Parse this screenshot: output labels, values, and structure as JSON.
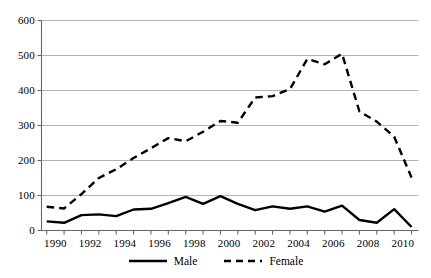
{
  "chart_data": {
    "type": "line",
    "title": "",
    "xlabel": "",
    "ylabel": "",
    "xlim": [
      1989.2,
      1910.8
    ],
    "ylim": [
      0,
      600
    ],
    "grid": true,
    "legend_position": "bottom-center",
    "y_ticks": [
      0,
      100,
      200,
      300,
      400,
      500,
      600
    ],
    "y_tick_labels": [
      "0",
      "100",
      "200",
      "300",
      "400",
      "500",
      "600"
    ],
    "x_tick_labels": [
      "1990",
      "1992",
      "1994",
      "1996",
      "1998",
      "2000",
      "2002",
      "2004",
      "2006",
      "2008",
      "2010"
    ],
    "x_tick_values": [
      1990,
      1992,
      1994,
      1996,
      1998,
      2000,
      2002,
      2004,
      2006,
      2008,
      2010
    ],
    "x_minor_ticks": [
      1989.5,
      1990.5,
      1991.5,
      1992.5,
      1993.5,
      1994.5,
      1995.5,
      1996.5,
      1997.5,
      1998.5,
      1999.5,
      2000.5,
      2001.5,
      2002.5,
      2003.5,
      2004.5,
      2005.5,
      2006.5,
      2007.5,
      2008.5,
      2009.5,
      2010.5
    ],
    "x": [
      1989.5,
      1990.5,
      1991.5,
      1992.5,
      1993.5,
      1994.5,
      1995.5,
      1996.5,
      1997.5,
      1998.5,
      1999.5,
      2000.5,
      2001.5,
      2002.5,
      2003.5,
      2004.5,
      2005.5,
      2006.5,
      2007.5,
      2008.5,
      2009.5,
      2010.5
    ],
    "series": [
      {
        "name": "Male",
        "style": "solid",
        "color": "#000000",
        "values": [
          26,
          22,
          44,
          46,
          41,
          60,
          62,
          78,
          96,
          76,
          98,
          76,
          58,
          69,
          62,
          69,
          54,
          71,
          30,
          22,
          61,
          10
        ]
      },
      {
        "name": "Female",
        "style": "dashed",
        "color": "#000000",
        "values": [
          68,
          63,
          104,
          150,
          175,
          207,
          235,
          264,
          255,
          282,
          313,
          308,
          380,
          384,
          404,
          490,
          475,
          505,
          340,
          311,
          268,
          151
        ]
      }
    ]
  },
  "legend": {
    "items": [
      {
        "label": "Male",
        "style": "solid"
      },
      {
        "label": "Female",
        "style": "dashed"
      }
    ]
  },
  "colors": {
    "line": "#000000",
    "grid": "#aaaaaa",
    "axis": "#555555",
    "background": "#ffffff"
  }
}
